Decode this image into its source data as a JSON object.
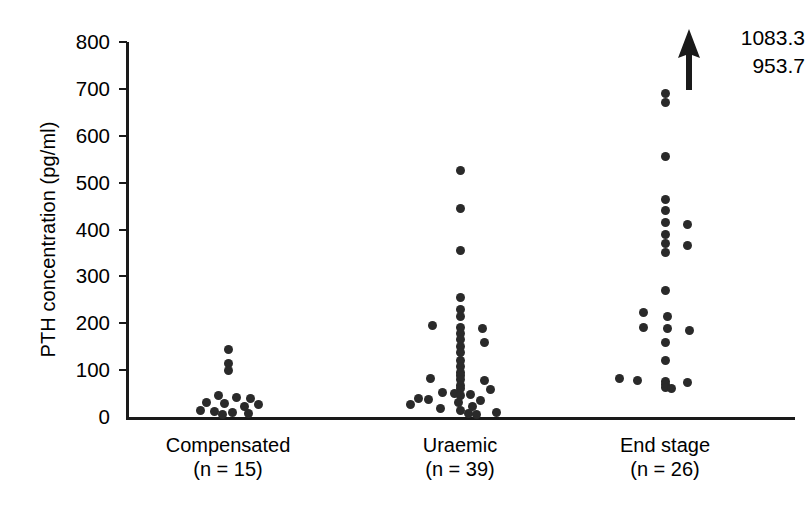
{
  "chart_data": {
    "type": "scatter",
    "title": "",
    "subtitle": "",
    "xlabel": "",
    "ylabel": "PTH concentration (pg/ml)",
    "ylim": [
      0,
      800
    ],
    "yticks": [
      0,
      100,
      200,
      300,
      400,
      500,
      600,
      700,
      800
    ],
    "ytick_labels": [
      "0",
      "100",
      "200",
      "300",
      "400",
      "500",
      "600",
      "700",
      "800"
    ],
    "grid": false,
    "legend": "none",
    "categories": [
      "Compensated",
      "Uraemic",
      "End stage"
    ],
    "group_counts": [
      "n = 15",
      "n = 39",
      "n = 26"
    ],
    "annotations": [
      {
        "kind": "arrow-up",
        "values": [
          "1083.3",
          "953.7"
        ],
        "group": "End stage"
      }
    ],
    "series": [
      {
        "name": "Compensated",
        "count": 15,
        "n_label": "(n = 15)",
        "points": [
          {
            "v": 145,
            "j": 0
          },
          {
            "v": 115,
            "j": 0
          },
          {
            "v": 100,
            "j": 0
          },
          {
            "v": 45,
            "j": -10
          },
          {
            "v": 42,
            "j": 8
          },
          {
            "v": 40,
            "j": 22
          },
          {
            "v": 30,
            "j": -22
          },
          {
            "v": 28,
            "j": -4
          },
          {
            "v": 26,
            "j": 30
          },
          {
            "v": 22,
            "j": 16
          },
          {
            "v": 14,
            "j": -28
          },
          {
            "v": 12,
            "j": -14
          },
          {
            "v": 10,
            "j": 4
          },
          {
            "v": 8,
            "j": 20
          },
          {
            "v": 6,
            "j": -6
          }
        ]
      },
      {
        "name": "Uraemic",
        "count": 39,
        "n_label": "(n = 39)",
        "points": [
          {
            "v": 525,
            "j": 0
          },
          {
            "v": 445,
            "j": 0
          },
          {
            "v": 355,
            "j": 0
          },
          {
            "v": 255,
            "j": 0
          },
          {
            "v": 230,
            "j": 0
          },
          {
            "v": 215,
            "j": 0
          },
          {
            "v": 195,
            "j": -28
          },
          {
            "v": 190,
            "j": 0
          },
          {
            "v": 188,
            "j": 22
          },
          {
            "v": 178,
            "j": 0
          },
          {
            "v": 165,
            "j": 0
          },
          {
            "v": 160,
            "j": 24
          },
          {
            "v": 150,
            "j": 0
          },
          {
            "v": 138,
            "j": 0
          },
          {
            "v": 120,
            "j": 0
          },
          {
            "v": 108,
            "j": 0
          },
          {
            "v": 95,
            "j": 0
          },
          {
            "v": 88,
            "j": 0
          },
          {
            "v": 82,
            "j": -30
          },
          {
            "v": 80,
            "j": 0
          },
          {
            "v": 78,
            "j": 24
          },
          {
            "v": 68,
            "j": 0
          },
          {
            "v": 60,
            "j": 0
          },
          {
            "v": 58,
            "j": 30
          },
          {
            "v": 52,
            "j": -18
          },
          {
            "v": 50,
            "j": -6
          },
          {
            "v": 48,
            "j": 10
          },
          {
            "v": 45,
            "j": 0
          },
          {
            "v": 40,
            "j": -42
          },
          {
            "v": 38,
            "j": -32
          },
          {
            "v": 35,
            "j": 20
          },
          {
            "v": 30,
            "j": -2
          },
          {
            "v": 26,
            "j": -50
          },
          {
            "v": 22,
            "j": 12
          },
          {
            "v": 18,
            "j": -20
          },
          {
            "v": 14,
            "j": 0
          },
          {
            "v": 10,
            "j": 36
          },
          {
            "v": 7,
            "j": 8
          },
          {
            "v": 5,
            "j": 16
          }
        ]
      },
      {
        "name": "End stage",
        "count": 26,
        "n_label": "(n = 26)",
        "points": [
          {
            "v": 690,
            "j": 0
          },
          {
            "v": 672,
            "j": 0
          },
          {
            "v": 555,
            "j": 0
          },
          {
            "v": 465,
            "j": 0
          },
          {
            "v": 440,
            "j": 0
          },
          {
            "v": 415,
            "j": 0
          },
          {
            "v": 410,
            "j": 22
          },
          {
            "v": 390,
            "j": 0
          },
          {
            "v": 370,
            "j": 0
          },
          {
            "v": 365,
            "j": 22
          },
          {
            "v": 352,
            "j": 0
          },
          {
            "v": 270,
            "j": 0
          },
          {
            "v": 222,
            "j": -22
          },
          {
            "v": 215,
            "j": 2
          },
          {
            "v": 190,
            "j": -22
          },
          {
            "v": 188,
            "j": 2
          },
          {
            "v": 185,
            "j": 24
          },
          {
            "v": 160,
            "j": 0
          },
          {
            "v": 120,
            "j": 0
          },
          {
            "v": 82,
            "j": -46
          },
          {
            "v": 78,
            "j": -28
          },
          {
            "v": 76,
            "j": 0
          },
          {
            "v": 74,
            "j": 22
          },
          {
            "v": 70,
            "j": 0
          },
          {
            "v": 62,
            "j": 0
          },
          {
            "v": 60,
            "j": 6
          }
        ]
      }
    ],
    "geometry": {
      "axis_x": 126,
      "y_top_px": 42,
      "y_zero_px": 417,
      "y_max": 800,
      "group_x": [
        228,
        460,
        665
      ],
      "plot_right": 795
    }
  }
}
